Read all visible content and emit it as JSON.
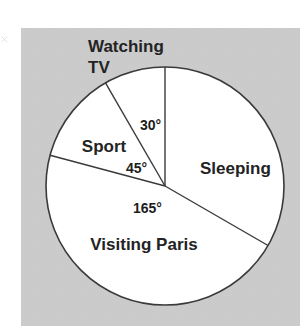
{
  "figure": {
    "background_color": "#ffffff",
    "panel_color": "#c9c9c9",
    "pie_fill_color": "#ffffff",
    "line_color": "#3a3a3a",
    "text_color": "#232323"
  },
  "chart_data": {
    "type": "pie",
    "title": "",
    "xlabel": "",
    "ylabel": "",
    "units": "degrees",
    "total_degrees": 360,
    "start_angle_deg": 0,
    "direction": "clockwise",
    "legend": "none",
    "grid": false,
    "categories": [
      "Sleeping",
      "Visiting Paris",
      "Sport",
      "Watching TV"
    ],
    "values": [
      120,
      165,
      45,
      30
    ],
    "value_labels": [
      "",
      "165°",
      "45°",
      "30°"
    ],
    "slices": [
      {
        "label": "Sleeping",
        "angle_deg": 120,
        "angle_label": "",
        "label_shown": true,
        "label_position": "inside",
        "label_x": 200,
        "label_y": 174
      },
      {
        "label": "Visiting Paris",
        "angle_deg": 165,
        "angle_label": "165°",
        "label_shown": true,
        "label_position": "inside",
        "label_x": 144,
        "label_y": 250,
        "angle_label_x": 156,
        "angle_label_y": 213
      },
      {
        "label": "Sport",
        "angle_deg": 45,
        "angle_label": "45°",
        "label_shown": true,
        "label_position": "inside",
        "label_x": 104,
        "label_y": 152,
        "angle_label_x": 140,
        "angle_label_y": 173
      },
      {
        "label": "Watching TV",
        "angle_deg": 30,
        "angle_label": "30°",
        "label_shown": true,
        "label_position": "outside",
        "label_line_1": "Watching",
        "label_line_2": "TV",
        "label_x": 88,
        "label_y": 52,
        "angle_label_x": 140,
        "angle_label_y": 130
      }
    ]
  },
  "geometry": {
    "center_x": 165,
    "center_y": 186,
    "radius": 119
  }
}
